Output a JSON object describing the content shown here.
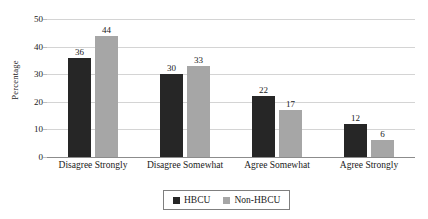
{
  "chart_data": {
    "type": "bar",
    "title": "",
    "subtitle": "",
    "xlabel": "",
    "ylabel": "Percentage",
    "ylim": [
      0,
      50
    ],
    "yticks": [
      0,
      10,
      20,
      30,
      40,
      50
    ],
    "ytick_labels": [
      "0",
      "10",
      "20",
      "30",
      "40",
      "50"
    ],
    "grid": true,
    "legend_position": "bottom",
    "categories": [
      "Disagree Strongly",
      "Disagree Somewhat",
      "Agree Somewhat",
      "Agree Strongly"
    ],
    "series": [
      {
        "name": "HBCU",
        "color": "#262626",
        "values": [
          36,
          30,
          22,
          12
        ],
        "value_labels": [
          "36",
          "30",
          "22",
          "12"
        ]
      },
      {
        "name": "Non-HBCU",
        "color": "#A6A6A6",
        "values": [
          44,
          33,
          17,
          6
        ],
        "value_labels": [
          "44",
          "33",
          "17",
          "6"
        ]
      }
    ]
  },
  "legend": {
    "items": [
      {
        "label": "HBCU",
        "color": "#262626"
      },
      {
        "label": "Non-HBCU",
        "color": "#A6A6A6"
      }
    ]
  },
  "colors": {
    "background": "#FFFFFF",
    "gridline": "#D4D4D4",
    "axis": "#8C8C8C",
    "text": "#1A1A1A",
    "series_hbcu": "#262626",
    "series_non_hbcu": "#A6A6A6"
  }
}
